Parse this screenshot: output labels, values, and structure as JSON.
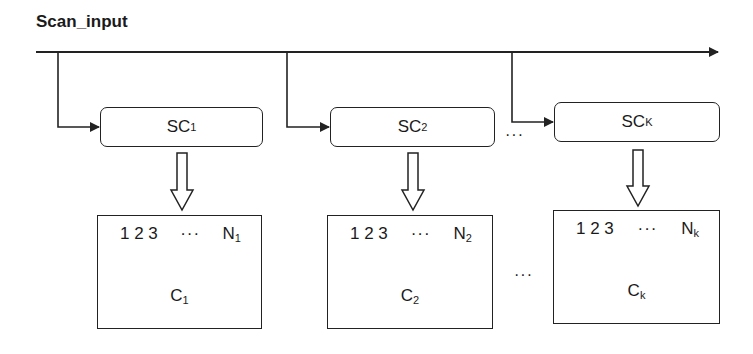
{
  "diagram": {
    "title": "Scan_input",
    "scan_chains": [
      {
        "label": "SC",
        "sub": "1"
      },
      {
        "label": "SC",
        "sub": "2"
      },
      {
        "label": "SC",
        "sub": "K"
      }
    ],
    "compactors": [
      {
        "seq": "1 2 3",
        "dots": "···",
        "n_label": "N",
        "n_sub": "1",
        "label": "C",
        "sub": "1"
      },
      {
        "seq": "1 2 3",
        "dots": "···",
        "n_label": "N",
        "n_sub": "2",
        "label": "C",
        "sub": "2"
      },
      {
        "seq": "1 2 3",
        "dots": "···",
        "n_label": "N",
        "n_sub": "k",
        "label": "C",
        "sub": "k"
      }
    ],
    "ellipsis_top": "···",
    "ellipsis_bottom": "···",
    "line_color": "#222222"
  }
}
